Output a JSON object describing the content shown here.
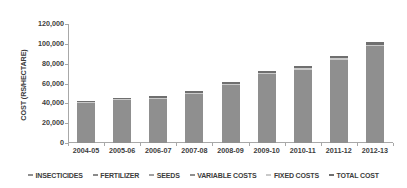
{
  "chart_data": {
    "type": "bar",
    "title": "",
    "subtitle": "",
    "xlabel": "",
    "ylabel": "COST (RS/HECTARE)",
    "categories": [
      "2004-05",
      "2005-06",
      "2006-07",
      "2007-08",
      "2008-09",
      "2009-10",
      "2010-11",
      "2011-12",
      "2012-13"
    ],
    "values": [
      42500,
      45500,
      47500,
      52500,
      62000,
      73000,
      77500,
      88000,
      101500
    ],
    "series": [
      {
        "name": "TOTAL COST",
        "values": [
          42500,
          45500,
          47500,
          52500,
          62000,
          73000,
          77500,
          88000,
          101500
        ]
      }
    ],
    "ylim": [
      0,
      120000
    ],
    "yticks": [
      0,
      20000,
      40000,
      60000,
      80000,
      100000,
      120000
    ],
    "ytick_labels": [
      "0",
      "20,000",
      "40,000",
      "60,000",
      "80,000",
      "100,000",
      "120,000"
    ],
    "grid": false,
    "legend_position": "bottom"
  },
  "legend": {
    "items": [
      {
        "label": "INSECTICIDES",
        "color": "#909090"
      },
      {
        "label": "FERTILIZER",
        "color": "#8a8a8a"
      },
      {
        "label": "SEEDS",
        "color": "#a0a0a0"
      },
      {
        "label": "VARIABLE COSTS",
        "color": "#8f8f8f"
      },
      {
        "label": "FIXED COSTS",
        "color": "#c9c9c9"
      },
      {
        "label": "TOTAL COST",
        "color": "#6f6f6f"
      }
    ]
  },
  "colors": {
    "bar_body": "#8c8c8c",
    "bar_cap": "#6f6f6f",
    "bar_cap_light": "#c9c9c9",
    "axis": "#a8a8a8",
    "text": "#3c3c3c",
    "background": "#ffffff"
  }
}
